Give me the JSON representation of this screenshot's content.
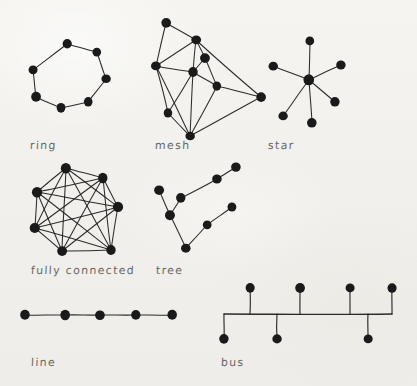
{
  "page": {
    "background_color": "#f3f2ee",
    "ink_color": "#1a1a1a",
    "label_color": "#4a4a48",
    "width": 417,
    "height": 386
  },
  "diagram_data": {
    "type": "diagram",
    "style": "hand-drawn sketch on paper",
    "topology_count": 7,
    "topologies": [
      {
        "id": "ring",
        "label": "ring",
        "label_pos": [
          30,
          139
        ],
        "node_count": 7,
        "edge_count": 7,
        "node_radius": 4.6,
        "nodes": [
          [
            67,
            44
          ],
          [
            97,
            52
          ],
          [
            106,
            79
          ],
          [
            88,
            102
          ],
          [
            61,
            108
          ],
          [
            36,
            97
          ],
          [
            33,
            70
          ]
        ],
        "edges": [
          [
            0,
            1
          ],
          [
            1,
            2
          ],
          [
            2,
            3
          ],
          [
            3,
            4
          ],
          [
            4,
            5
          ],
          [
            5,
            6
          ],
          [
            6,
            0
          ]
        ]
      },
      {
        "id": "mesh",
        "label": "mesh",
        "label_pos": [
          155,
          139
        ],
        "node_count": 9,
        "edge_count": 18,
        "node_radius": 4.6,
        "nodes": [
          [
            166,
            23
          ],
          [
            196,
            40
          ],
          [
            205,
            58
          ],
          [
            156,
            66
          ],
          [
            193,
            72
          ],
          [
            217,
            86
          ],
          [
            168,
            113
          ],
          [
            261,
            97
          ],
          [
            190,
            136
          ]
        ],
        "edges": [
          [
            0,
            1
          ],
          [
            0,
            3
          ],
          [
            1,
            2
          ],
          [
            1,
            3
          ],
          [
            1,
            4
          ],
          [
            1,
            7
          ],
          [
            2,
            4
          ],
          [
            2,
            5
          ],
          [
            3,
            4
          ],
          [
            3,
            6
          ],
          [
            4,
            5
          ],
          [
            4,
            6
          ],
          [
            4,
            8
          ],
          [
            5,
            7
          ],
          [
            5,
            8
          ],
          [
            6,
            8
          ],
          [
            7,
            8
          ],
          [
            3,
            8
          ]
        ]
      },
      {
        "id": "star",
        "label": "star",
        "label_pos": [
          268,
          139
        ],
        "node_count": 7,
        "edge_count": 6,
        "node_radius": 4.6,
        "hub_index": 0,
        "nodes": [
          [
            309,
            80
          ],
          [
            310,
            41
          ],
          [
            273,
            66
          ],
          [
            341,
            65
          ],
          [
            335,
            102
          ],
          [
            312,
            123
          ],
          [
            283,
            116
          ]
        ],
        "edges": [
          [
            0,
            1
          ],
          [
            0,
            2
          ],
          [
            0,
            3
          ],
          [
            0,
            4
          ],
          [
            0,
            5
          ],
          [
            0,
            6
          ]
        ]
      },
      {
        "id": "fully-connected",
        "label": "fully connected",
        "label_pos": [
          31,
          264
        ],
        "node_count": 7,
        "edge_count": 21,
        "node_radius": 5.0,
        "nodes": [
          [
            66,
            168
          ],
          [
            103,
            178
          ],
          [
            37,
            192
          ],
          [
            118,
            207
          ],
          [
            35,
            228
          ],
          [
            62,
            251
          ],
          [
            111,
            250
          ]
        ],
        "edges": [
          [
            0,
            1
          ],
          [
            0,
            2
          ],
          [
            0,
            3
          ],
          [
            0,
            4
          ],
          [
            0,
            5
          ],
          [
            0,
            6
          ],
          [
            1,
            2
          ],
          [
            1,
            3
          ],
          [
            1,
            4
          ],
          [
            1,
            5
          ],
          [
            1,
            6
          ],
          [
            2,
            3
          ],
          [
            2,
            4
          ],
          [
            2,
            5
          ],
          [
            2,
            6
          ],
          [
            3,
            4
          ],
          [
            3,
            5
          ],
          [
            3,
            6
          ],
          [
            4,
            5
          ],
          [
            4,
            6
          ],
          [
            5,
            6
          ]
        ]
      },
      {
        "id": "tree",
        "label": "tree",
        "label_pos": [
          156,
          264
        ],
        "node_count": 8,
        "edge_count": 7,
        "node_radius": 4.6,
        "nodes": [
          [
            159,
            190
          ],
          [
            170,
            215
          ],
          [
            181,
            198
          ],
          [
            217,
            179
          ],
          [
            236,
            167
          ],
          [
            186,
            248
          ],
          [
            207,
            225
          ],
          [
            232,
            207
          ]
        ],
        "edges": [
          [
            0,
            1
          ],
          [
            1,
            2
          ],
          [
            2,
            3
          ],
          [
            3,
            4
          ],
          [
            1,
            5
          ],
          [
            5,
            6
          ],
          [
            6,
            7
          ]
        ]
      },
      {
        "id": "line",
        "label": "line",
        "label_pos": [
          31,
          356
        ],
        "node_count": 5,
        "edge_count": 4,
        "node_radius": 5.0,
        "nodes": [
          [
            25,
            315
          ],
          [
            65,
            315
          ],
          [
            100,
            315
          ],
          [
            136,
            315
          ],
          [
            172,
            315
          ]
        ],
        "edges": [
          [
            0,
            1
          ],
          [
            1,
            2
          ],
          [
            2,
            3
          ],
          [
            3,
            4
          ]
        ]
      },
      {
        "id": "bus",
        "label": "bus",
        "label_pos": [
          221,
          356
        ],
        "node_count": 7,
        "node_radius": 4.6,
        "bus_bar": {
          "y": 314,
          "x_start": 224,
          "x_end": 392
        },
        "nodes": [
          [
            250,
            288
          ],
          [
            300,
            288
          ],
          [
            350,
            288
          ],
          [
            392,
            288
          ],
          [
            224,
            339
          ],
          [
            277,
            339
          ],
          [
            368,
            339
          ]
        ],
        "stubs": [
          [
            250,
            288,
            250,
            314
          ],
          [
            300,
            288,
            300,
            314
          ],
          [
            350,
            288,
            350,
            314
          ],
          [
            392,
            288,
            392,
            314
          ],
          [
            224,
            314,
            224,
            339
          ],
          [
            277,
            314,
            277,
            339
          ],
          [
            368,
            314,
            368,
            339
          ]
        ]
      }
    ]
  }
}
